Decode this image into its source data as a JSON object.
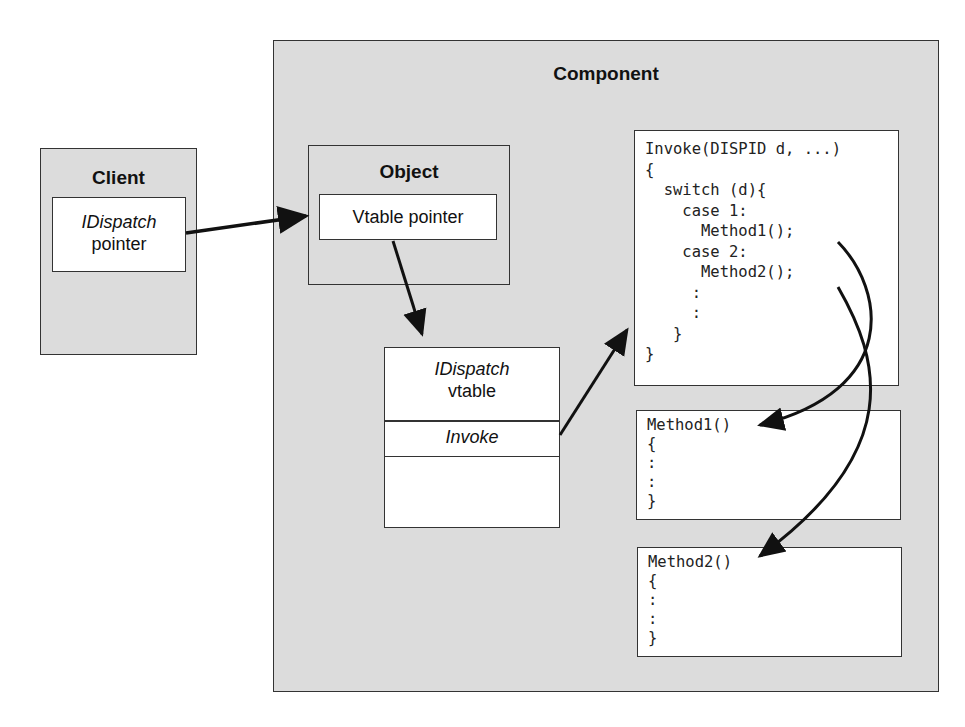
{
  "component": {
    "title": "Component"
  },
  "client": {
    "title": "Client",
    "pointer_box": {
      "line1": "IDispatch",
      "line2": "pointer"
    }
  },
  "object": {
    "title": "Object",
    "vtable_pointer": "Vtable pointer"
  },
  "vtable": {
    "header_line1": "IDispatch",
    "header_line2": "vtable",
    "entry_invoke": "Invoke"
  },
  "invoke_code": {
    "text": "Invoke(DISPID d, ...)\n{\n  switch (d){\n    case 1:\n      Method1();\n    case 2:\n      Method2();\n     :\n     :\n   }\n}"
  },
  "method1": {
    "text": "Method1()\n{\n:\n:\n}"
  },
  "method2": {
    "text": "Method2()\n{\n:\n:\n}"
  },
  "arrows": [
    {
      "from": "client.pointer_box",
      "to": "object.vtable_pointer"
    },
    {
      "from": "object.vtable_pointer",
      "to": "vtable"
    },
    {
      "from": "vtable.entry_invoke",
      "to": "invoke_code"
    },
    {
      "from": "invoke_code.Method1()",
      "to": "method1"
    },
    {
      "from": "invoke_code.Method2()",
      "to": "method2"
    }
  ],
  "colors": {
    "box_gray": "#dcdcdc",
    "box_white": "#ffffff",
    "line": "#111111"
  }
}
